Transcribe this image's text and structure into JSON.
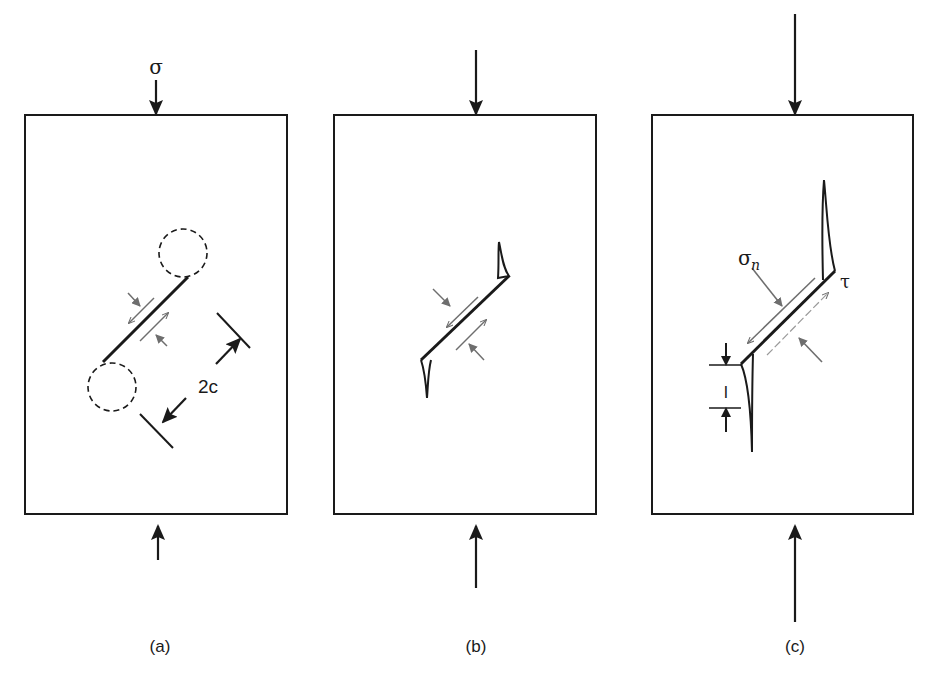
{
  "figure": {
    "panels": [
      {
        "id": "a",
        "caption": "(a)",
        "load_label": "σ",
        "dimension_label": "2c",
        "description": "Closed crack under compression with frictional sliding; dashed circles mark crack-tip zones"
      },
      {
        "id": "b",
        "caption": "(b)",
        "description": "Wing cracks initiating from crack tips"
      },
      {
        "id": "c",
        "caption": "(c)",
        "normal_stress_label": "σ",
        "normal_stress_subscript": "n",
        "shear_stress_label": "τ",
        "wing_length_label": "l",
        "description": "Wing cracks grown parallel to compression axis with length l"
      }
    ],
    "colors": {
      "line": "#1a1a1a",
      "shear_arrows": "#6e6e6e",
      "background": "#ffffff"
    }
  }
}
